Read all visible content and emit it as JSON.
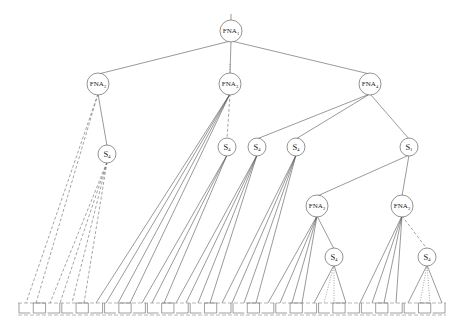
{
  "diagram": {
    "type": "tree",
    "title": "",
    "nodes": [
      {
        "id": "n0",
        "label": "FNA",
        "sub": "1",
        "x": 231,
        "y": 31,
        "r": 11,
        "kind": "fna"
      },
      {
        "id": "n1",
        "label": "FNA",
        "sub": "2",
        "x": 98,
        "y": 84,
        "r": 11,
        "kind": "fna"
      },
      {
        "id": "n2",
        "label": "FNA",
        "sub": "3",
        "x": 230,
        "y": 84,
        "r": 11,
        "kind": "fna"
      },
      {
        "id": "n3",
        "label": "FNA",
        "sub": "4",
        "x": 370,
        "y": 84,
        "r": 11,
        "kind": "fna"
      },
      {
        "id": "n4",
        "label": "S",
        "sub": "4",
        "x": 107,
        "y": 154,
        "r": 9,
        "kind": "s"
      },
      {
        "id": "n5",
        "label": "S",
        "sub": "4",
        "x": 227,
        "y": 147,
        "r": 9,
        "kind": "s"
      },
      {
        "id": "n6",
        "label": "S",
        "sub": "4",
        "x": 257,
        "y": 147,
        "r": 9,
        "kind": "s"
      },
      {
        "id": "n7",
        "label": "S",
        "sub": "4",
        "x": 296,
        "y": 147,
        "r": 9,
        "kind": "s"
      },
      {
        "id": "n8",
        "label": "S",
        "sub": "1",
        "x": 409,
        "y": 147,
        "r": 9,
        "kind": "s"
      },
      {
        "id": "n9",
        "label": "FNA",
        "sub": "2",
        "x": 317,
        "y": 206,
        "r": 11,
        "kind": "fna"
      },
      {
        "id": "n10",
        "label": "FNA",
        "sub": "2",
        "x": 402,
        "y": 206,
        "r": 11,
        "kind": "fna"
      },
      {
        "id": "n11",
        "label": "S",
        "sub": "4",
        "x": 334,
        "y": 257,
        "r": 9,
        "kind": "s"
      },
      {
        "id": "n12",
        "label": "S",
        "sub": "4",
        "x": 427,
        "y": 257,
        "r": 9,
        "kind": "s"
      }
    ],
    "edges": [
      {
        "from": "n0",
        "to": "n1",
        "style": "solid"
      },
      {
        "from": "n0",
        "to": "n2",
        "style": "solid"
      },
      {
        "from": "n0",
        "to": "n3",
        "style": "solid"
      },
      {
        "from": "n1",
        "to": "n4",
        "style": "solid"
      },
      {
        "from": "n2",
        "to": "n5",
        "style": "dashed"
      },
      {
        "from": "n3",
        "to": "n6",
        "style": "solid"
      },
      {
        "from": "n3",
        "to": "n7",
        "style": "solid"
      },
      {
        "from": "n3",
        "to": "n8",
        "style": "solid"
      },
      {
        "from": "n8",
        "to": "n9",
        "style": "solid"
      },
      {
        "from": "n8",
        "to": "n10",
        "style": "solid"
      },
      {
        "from": "n9",
        "to": "n11",
        "style": "solid"
      },
      {
        "from": "n10",
        "to": "n12",
        "style": "dashed"
      }
    ],
    "leaf_fans": [
      {
        "from": "n1",
        "xs": [
          26,
          36
        ],
        "style": "dashed"
      },
      {
        "from": "n4",
        "xs": [
          50,
          60,
          72,
          84
        ],
        "style": "dashed"
      },
      {
        "from": "n2",
        "xs": [
          96,
          106,
          118,
          130
        ],
        "style": "solid"
      },
      {
        "from": "n5",
        "xs": [
          142,
          152,
          164
        ],
        "style": "solid"
      },
      {
        "from": "n6",
        "xs": [
          176,
          186,
          198,
          210
        ],
        "style": "solid"
      },
      {
        "from": "n7",
        "xs": [
          222,
          232,
          244,
          256
        ],
        "style": "solid"
      },
      {
        "from": "n9",
        "xs": [
          268,
          280,
          292,
          302
        ],
        "style": "solid"
      },
      {
        "from": "n11",
        "xs": [
          314,
          324,
          334,
          346
        ],
        "style": "mixed"
      },
      {
        "from": "n10",
        "xs": [
          360,
          372,
          384,
          396
        ],
        "style": "solid"
      },
      {
        "from": "n12",
        "xs": [
          408,
          420,
          430,
          442
        ],
        "style": "mixed"
      }
    ],
    "leaf_row": {
      "y_top": 303,
      "y_bottom": 313,
      "x_start": 18,
      "x_end": 446,
      "cells": 30
    },
    "root_stub": {
      "x": 231,
      "y1": 14,
      "y2": 20
    },
    "mid_stub": {
      "x": 230,
      "y1": 64,
      "y2": 73
    }
  }
}
